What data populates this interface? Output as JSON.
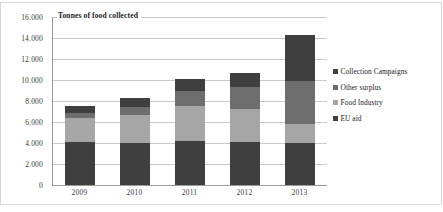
{
  "chart_data": {
    "type": "bar",
    "subtype": "stacked-column",
    "title": "Tonnes of food collected",
    "xlabel": "",
    "ylabel": "",
    "categories": [
      "2009",
      "2010",
      "2011",
      "2012",
      "2013"
    ],
    "ylim": [
      0,
      16000
    ],
    "ytick_step": 2000,
    "ytick_labels": [
      "16.000",
      "14.000",
      "12.000",
      "10.000",
      "8.000",
      "6.000",
      "4.000",
      "2.000",
      "0"
    ],
    "ytick_values": [
      16000,
      14000,
      12000,
      10000,
      8000,
      6000,
      4000,
      2000,
      0
    ],
    "grid": true,
    "grid_axis": "y",
    "legend_position": "right",
    "stack_order_bottom_to_top": [
      "EU aid",
      "Food Industry",
      "Other surplus",
      "Collection Campaigns"
    ],
    "series": [
      {
        "name": "EU aid",
        "color": "#3f3f3f",
        "values": [
          4050,
          4000,
          4150,
          4100,
          4000
        ]
      },
      {
        "name": "Food Industry",
        "color": "#a6a6a6",
        "values": [
          2350,
          2700,
          3350,
          3150,
          1850
        ]
      },
      {
        "name": "Other surplus",
        "color": "#6e6e6e",
        "values": [
          500,
          700,
          1450,
          2050,
          4050
        ]
      },
      {
        "name": "Collection Campaigns",
        "color": "#3f3f3f",
        "values": [
          600,
          900,
          1150,
          1400,
          4400
        ]
      }
    ],
    "totals": [
      7500,
      8300,
      10100,
      10700,
      14300
    ]
  },
  "legend": {
    "items": [
      {
        "label": "Collection Campaigns",
        "color": "#3f3f3f"
      },
      {
        "label": "Other surplus",
        "color": "#6e6e6e"
      },
      {
        "label": "Food Industry",
        "color": "#a6a6a6"
      },
      {
        "label": "EU aid",
        "color": "#3f3f3f"
      }
    ]
  },
  "colors": {
    "gridline": "#c9c9c9",
    "axis": "#9a9a9a",
    "text": "#3a3a3a",
    "plot_background": "#ffffff"
  }
}
